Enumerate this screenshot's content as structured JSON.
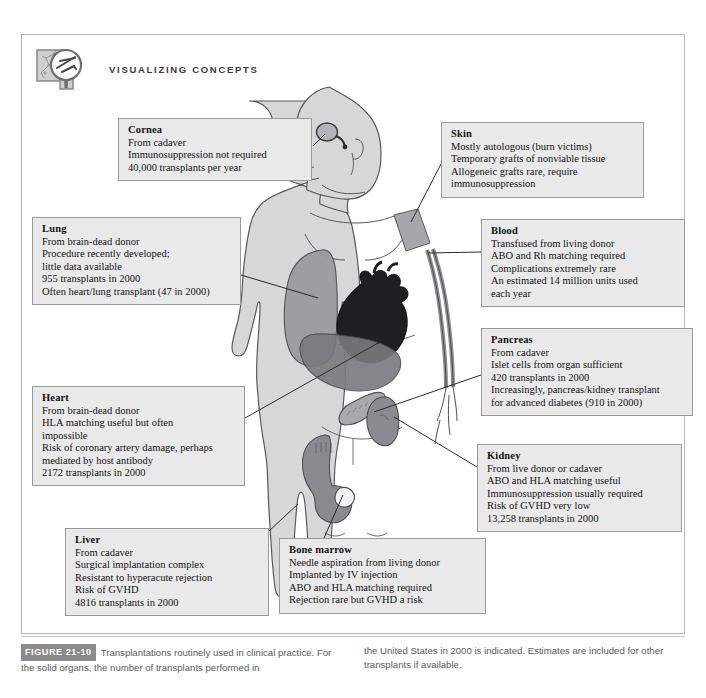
{
  "header": {
    "title": "VISUALIZING CONCEPTS",
    "icon": "magnifier-over-chart-icon"
  },
  "figure": {
    "number_label": "FIGURE 21-10",
    "caption_col1": "Transplantations routinely used in clinical practice. For the solid organs, the number of transplants performed in",
    "caption_col2": "the United States in 2000 is indicated. Estimates are included for other transplants if available."
  },
  "colors": {
    "box_fill": "#e9e9e9",
    "box_border": "#9a9a9a",
    "frame_border": "#b9b9b9",
    "body_fill": "#d8d8d8",
    "body_outline": "#55555a",
    "organ_mid": "#9a9a9e",
    "organ_dark": "#6e6e72",
    "heart_dark": "#1e1e20",
    "fig_num_bg": "#8b8b8b",
    "caption_text": "#5b5b5b"
  },
  "callouts": [
    {
      "id": "cornea",
      "title": "Cornea",
      "lines": [
        "From cadaver",
        "Immunosuppression not required",
        "40,000 transplants per year"
      ]
    },
    {
      "id": "skin",
      "title": "Skin",
      "lines": [
        "Mostly autologous (burn victims)",
        "Temporary grafts of nonviable tissue",
        "Allogeneic grafts rare, require",
        "immunosuppression"
      ]
    },
    {
      "id": "lung",
      "title": "Lung",
      "lines": [
        "From brain-dead donor",
        "Procedure recently developed;",
        "little data available",
        "955 transplants in 2000",
        "Often heart/lung transplant (47 in 2000)"
      ]
    },
    {
      "id": "blood",
      "title": "Blood",
      "lines": [
        "Transfused from living donor",
        "ABO and Rh matching required",
        "Complications extremely rare",
        "An estimated 14 million units used",
        "each year"
      ]
    },
    {
      "id": "pancreas",
      "title": "Pancreas",
      "lines": [
        "From cadaver",
        "Islet cells from organ sufficient",
        "420 transplants in 2000",
        "Increasingly, pancreas/kidney transplant",
        "for advanced diabetes (910 in 2000)"
      ]
    },
    {
      "id": "heart",
      "title": "Heart",
      "lines": [
        "From brain-dead donor",
        "HLA matching useful but often",
        "impossible",
        "Risk of coronary artery damage, perhaps",
        "mediated by host antibody",
        "2172 transplants in 2000"
      ]
    },
    {
      "id": "kidney",
      "title": "Kidney",
      "lines": [
        "From live donor or cadaver",
        "ABO and HLA matching useful",
        "Immunosuppression usually required",
        "Risk of GVHD very low",
        "13,258 transplants in 2000"
      ]
    },
    {
      "id": "liver",
      "title": "Liver",
      "lines": [
        "From cadaver",
        "Surgical implantation complex",
        "Resistant to hyperacute rejection",
        "Risk of GVHD",
        "4816 transplants in 2000"
      ]
    },
    {
      "id": "bone-marrow",
      "title": "Bone marrow",
      "lines": [
        "Needle aspiration from living donor",
        "Implanted by IV injection",
        "ABO and HLA matching required",
        "Rejection rare but GVHD a risk"
      ]
    }
  ],
  "illustration": {
    "subject": "human-body-anterior-view",
    "organs": [
      "cornea",
      "skin",
      "lung",
      "blood-vessels",
      "heart",
      "liver",
      "pancreas",
      "kidney",
      "pelvis-bone-marrow"
    ]
  }
}
